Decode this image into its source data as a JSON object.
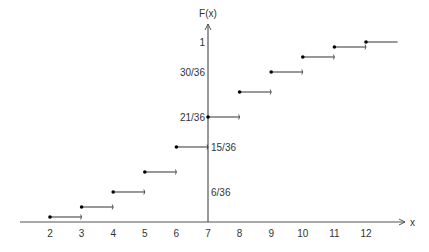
{
  "chart_data": {
    "type": "line",
    "subtype": "step-cdf",
    "title": "",
    "xlabel": "x",
    "ylabel": "F(x)",
    "xlim": [
      0.95,
      13.6
    ],
    "ylim": [
      0,
      1.1
    ],
    "x_ticks": [
      "2",
      "3",
      "4",
      "5",
      "6",
      "7",
      "8",
      "9",
      "10",
      "11",
      "12"
    ],
    "y_tick_labels": [
      {
        "value": 1,
        "label": "1",
        "side": "left"
      },
      {
        "value": 0.8333,
        "label": "30/36",
        "side": "left"
      },
      {
        "value": 0.5833,
        "label": "21/36",
        "side": "left"
      },
      {
        "value": 0.4167,
        "label": "15/36",
        "side": "right"
      },
      {
        "value": 0.1667,
        "label": "6/36",
        "side": "right"
      }
    ],
    "steps": [
      {
        "x": 2,
        "x_end": 3,
        "y": 0.0278
      },
      {
        "x": 3,
        "x_end": 4,
        "y": 0.0833
      },
      {
        "x": 4,
        "x_end": 5,
        "y": 0.1667
      },
      {
        "x": 5,
        "x_end": 6,
        "y": 0.2778
      },
      {
        "x": 6,
        "x_end": 7,
        "y": 0.4167
      },
      {
        "x": 7,
        "x_end": 8,
        "y": 0.5833
      },
      {
        "x": 8,
        "x_end": 9,
        "y": 0.7222
      },
      {
        "x": 9,
        "x_end": 10,
        "y": 0.8333
      },
      {
        "x": 10,
        "x_end": 11,
        "y": 0.9167
      },
      {
        "x": 11,
        "x_end": 12,
        "y": 0.9722
      },
      {
        "x": 12,
        "x_end": 13,
        "y": 1.0,
        "open_end": false
      }
    ],
    "y_axis_at_x": 7,
    "grid": false,
    "legend": "none",
    "colors": {
      "line": "#333333",
      "axis": "#555555"
    }
  }
}
